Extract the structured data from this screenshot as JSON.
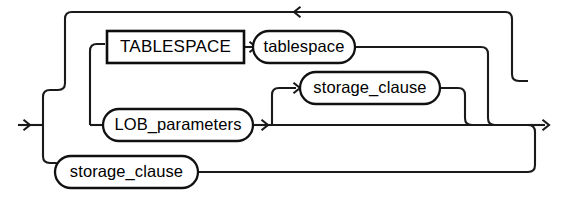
{
  "diagram": {
    "kind": "railroad-syntax-diagram",
    "title": "",
    "canvas": {
      "width": 561,
      "height": 202
    },
    "colors": {
      "rail": "#1a1a1a",
      "box_stroke": "#0d0d0d",
      "oval_stroke": "#111111",
      "text": "#000000",
      "background": "#ffffff"
    },
    "nodes": [
      {
        "id": "tablespace-keyword",
        "shape": "rect",
        "label": "TABLESPACE",
        "x": 107,
        "y": 31,
        "width": 137,
        "height": 32
      },
      {
        "id": "tablespace-name",
        "shape": "oval",
        "label": "tablespace",
        "x": 253,
        "y": 31,
        "width": 102,
        "height": 32
      },
      {
        "id": "storage-clause-middle",
        "shape": "oval",
        "label": "storage_clause",
        "x": 300,
        "y": 72,
        "width": 140,
        "height": 32
      },
      {
        "id": "lob-parameters",
        "shape": "oval",
        "label": "LOB_parameters",
        "x": 103,
        "y": 109,
        "width": 150,
        "height": 32
      },
      {
        "id": "storage-clause-bottom",
        "shape": "oval",
        "label": "storage_clause",
        "x": 55,
        "y": 156,
        "width": 143,
        "height": 32
      }
    ],
    "rails": [
      {
        "id": "entry-line",
        "name": "entry-rail",
        "d": "M 18,125 L 43,125"
      },
      {
        "id": "entry-fork-vertical",
        "name": "entry-fork-rail",
        "d": "M 43,125 L 43,97 Q 43,90 50,90 L 58,90"
      },
      {
        "id": "entry-fork-vertical-down",
        "name": "entry-fork-down-rail",
        "d": "M 43,125 L 43,156 Q 43,163 50,163 L 56,163"
      },
      {
        "id": "top-loop-left-riser",
        "name": "top-loop-left-rail",
        "d": "M 58,90 Q 65,90 65,83 L 65,19 Q 65,12 72,12 L 290,12"
      },
      {
        "id": "top-loop-top-line",
        "name": "top-loop-return-rail",
        "d": "M 290,12 L 505,12 Q 512,12 512,19 L 512,74 Q 512,81 519,81 L 528,81"
      },
      {
        "id": "inner-branch-riser",
        "name": "tablespace-branch-rail",
        "d": "M 90,125 L 90,51 Q 90,44 97,44 L 105,44"
      },
      {
        "id": "tablespace-kw-to-name",
        "name": "tablespace-connector-rail",
        "d": "M 244,47 L 256,47"
      },
      {
        "id": "tablespace-name-exit",
        "name": "tablespace-exit-rail",
        "d": "M 355,47 L 481,47 Q 488,47 488,54 L 488,118 Q 488,125 495,125 L 505,125"
      },
      {
        "id": "lob-entry",
        "name": "lob-parameters-entry-rail",
        "d": "M 90,125 L 106,125"
      },
      {
        "id": "lob-exit-to-main",
        "name": "lob-parameters-exit-rail",
        "d": "M 253,125 L 272,125"
      },
      {
        "id": "storage-mid-branch-riser",
        "name": "storage-clause-middle-branch-rail",
        "d": "M 272,125 L 272,95 Q 272,88 279,88 L 296,88"
      },
      {
        "id": "storage-mid-exit",
        "name": "storage-clause-middle-exit-rail",
        "d": "M 440,88 L 458,88 Q 465,88 465,95 L 465,118 Q 465,125 472,125 L 482,125"
      },
      {
        "id": "main-straight-through",
        "name": "main-bypass-rail",
        "d": "M 272,125 L 528,125"
      },
      {
        "id": "right-merge-exit",
        "name": "exit-rail",
        "d": "M 528,125 L 545,125"
      },
      {
        "id": "bottom-storage-entry",
        "name": "storage-clause-bottom-entry-rail",
        "d": "M 56,163 Q 58,163 58,168 L 58,172"
      },
      {
        "id": "bottom-storage-exit",
        "name": "storage-clause-bottom-exit-rail",
        "d": "M 198,172 L 528,172 Q 535,172 535,165 L 535,132 Q 535,125 528,125"
      }
    ],
    "arrows": [
      {
        "id": "entry-arrow",
        "name": "entry-arrowhead",
        "x": 30,
        "y": 125,
        "direction": "right"
      },
      {
        "id": "top-loop-arrow",
        "name": "loop-back-arrowhead",
        "x": 294,
        "y": 12,
        "direction": "left"
      },
      {
        "id": "tablespace-name-arrow",
        "name": "tablespace-name-arrowhead",
        "x": 256,
        "y": 47,
        "direction": "right"
      },
      {
        "id": "storage-mid-arrow",
        "name": "storage-clause-middle-arrowhead",
        "x": 300,
        "y": 88,
        "direction": "right"
      },
      {
        "id": "lob-exit-arrow",
        "name": "lob-parameters-arrowhead",
        "x": 268,
        "y": 125,
        "direction": "right"
      },
      {
        "id": "exit-arrow",
        "name": "exit-arrowhead",
        "x": 549,
        "y": 125,
        "direction": "right"
      }
    ]
  }
}
